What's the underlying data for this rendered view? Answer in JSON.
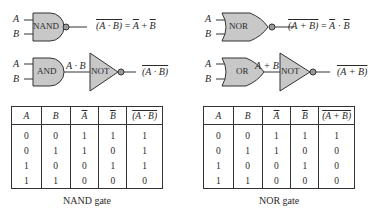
{
  "nand_panel": {
    "gate1": {
      "inputs": [
        "A",
        "B"
      ],
      "gate_label": "NAND",
      "output_expr_lhs": "(A · B)",
      "output_expr_eq": "=",
      "output_expr_rhs_a": "A",
      "output_expr_op": "+",
      "output_expr_rhs_b": "B"
    },
    "gate2": {
      "inputs": [
        "A",
        "B"
      ],
      "and_label": "AND",
      "mid_expr": "A · B",
      "not_label": "NOT",
      "output_expr": "(A · B)"
    },
    "table": {
      "headers": [
        "A",
        "B",
        "A",
        "B",
        "(A · B)"
      ],
      "header_overline": [
        false,
        false,
        true,
        true,
        true
      ],
      "rows": [
        [
          "0",
          "0",
          "1",
          "1",
          "1"
        ],
        [
          "0",
          "1",
          "1",
          "0",
          "1"
        ],
        [
          "1",
          "0",
          "0",
          "1",
          "1"
        ],
        [
          "1",
          "1",
          "0",
          "0",
          "0"
        ]
      ]
    },
    "caption": "NAND gate"
  },
  "nor_panel": {
    "gate1": {
      "inputs": [
        "A",
        "B"
      ],
      "gate_label": "NOR",
      "output_expr_lhs": "(A + B)",
      "output_expr_eq": "=",
      "output_expr_rhs_a": "A",
      "output_expr_op": "·",
      "output_expr_rhs_b": "B"
    },
    "gate2": {
      "inputs": [
        "A",
        "B"
      ],
      "or_label": "OR",
      "mid_expr": "A + B",
      "not_label": "NOT",
      "output_expr": "(A + B)"
    },
    "table": {
      "headers": [
        "A",
        "B",
        "A",
        "B",
        "(A + B)"
      ],
      "header_overline": [
        false,
        false,
        true,
        true,
        true
      ],
      "rows": [
        [
          "0",
          "0",
          "1",
          "1",
          "1"
        ],
        [
          "0",
          "1",
          "1",
          "0",
          "0"
        ],
        [
          "1",
          "0",
          "0",
          "1",
          "0"
        ],
        [
          "1",
          "1",
          "0",
          "0",
          "0"
        ]
      ]
    },
    "caption": "NOR gate"
  },
  "colors": {
    "gate_fill": "#c8c8c8",
    "stroke": "#333333",
    "text": "#2a2a2a",
    "background": "#ffffff"
  }
}
